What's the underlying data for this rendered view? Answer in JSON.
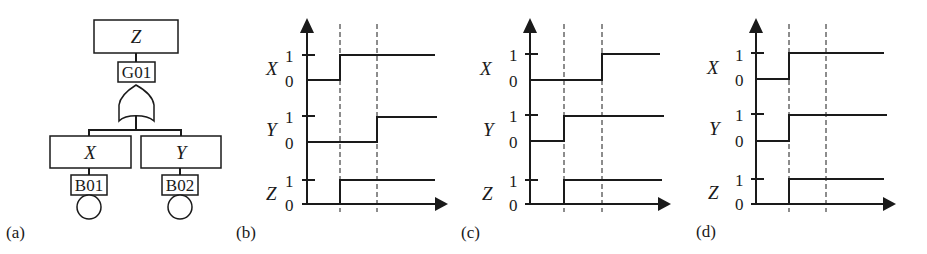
{
  "fault_tree": {
    "label": "(a)",
    "top_event": "Z",
    "gate": {
      "id": "G01",
      "type": "OR"
    },
    "children": [
      {
        "event": "X",
        "basic_event": "B01"
      },
      {
        "event": "Y",
        "basic_event": "B02"
      }
    ]
  },
  "timing_panels": [
    {
      "label": "(b)",
      "signals": [
        {
          "name": "X",
          "high": "1",
          "low": "0",
          "transitions": [
            "low",
            "high",
            "high"
          ]
        },
        {
          "name": "Y",
          "high": "1",
          "low": "0",
          "transitions": [
            "low",
            "low",
            "high"
          ]
        },
        {
          "name": "Z",
          "high": "1",
          "low": "0",
          "transitions": [
            "low",
            "high",
            "high"
          ]
        }
      ]
    },
    {
      "label": "(c)",
      "signals": [
        {
          "name": "X",
          "high": "1",
          "low": "0",
          "transitions": [
            "low",
            "low",
            "high"
          ]
        },
        {
          "name": "Y",
          "high": "1",
          "low": "0",
          "transitions": [
            "low",
            "high",
            "high"
          ]
        },
        {
          "name": "Z",
          "high": "1",
          "low": "0",
          "transitions": [
            "low",
            "high",
            "high"
          ]
        }
      ]
    },
    {
      "label": "(d)",
      "signals": [
        {
          "name": "X",
          "high": "1",
          "low": "0",
          "transitions": [
            "low",
            "high",
            "high"
          ]
        },
        {
          "name": "Y",
          "high": "1",
          "low": "0",
          "transitions": [
            "low",
            "high",
            "high"
          ]
        },
        {
          "name": "Z",
          "high": "1",
          "low": "0",
          "transitions": [
            "low",
            "high",
            "high"
          ]
        }
      ]
    }
  ]
}
